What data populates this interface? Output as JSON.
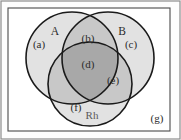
{
  "figure": {
    "name": "three-set-venn-diagram",
    "universe_label": "",
    "outer_border_color": "#8c8c8c",
    "frame_border_color": "#4a4a4a",
    "circle_outline_color": "#1a1a1a",
    "background_color": "#fdfdfd"
  },
  "sets": [
    {
      "id": "A",
      "label": "A",
      "position": "top-left"
    },
    {
      "id": "B",
      "label": "B",
      "position": "top-right"
    },
    {
      "id": "Rh",
      "label": "Rh",
      "position": "bottom-center"
    }
  ],
  "regions": [
    {
      "id": "a",
      "label": "(a)",
      "description": "A only",
      "shade": "#e2e2e2"
    },
    {
      "id": "b",
      "label": "(b)",
      "description": "A and B only",
      "shade": "#c8c8c8"
    },
    {
      "id": "c",
      "label": "(c)",
      "description": "B only",
      "shade": "#e2e2e2"
    },
    {
      "id": "d",
      "label": "(d)",
      "description": "A and B and Rh",
      "shade": "#a8a8a8"
    },
    {
      "id": "e",
      "label": "(e)",
      "description": "B and Rh only",
      "shade": "#c8c8c8"
    },
    {
      "id": "f",
      "label": "(f)",
      "description": "Rh only",
      "shade": "#e2e2e2"
    },
    {
      "id": "g",
      "label": "(g)",
      "description": "outside all sets",
      "shade": "#fdfdfd"
    }
  ],
  "shading": {
    "single": "#e2e2e2",
    "double": "#c8c8c8",
    "triple": "#a8a8a8",
    "outside": "#fdfdfd"
  }
}
